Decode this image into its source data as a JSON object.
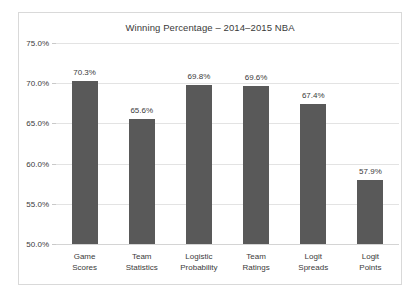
{
  "chart_data": {
    "type": "bar",
    "title": "Winning Percentage – 2014–2015 NBA",
    "xlabel": "",
    "ylabel": "",
    "ylim": [
      50.0,
      75.0
    ],
    "ytick_labels": [
      "75.0%",
      "70.0%",
      "65.0%",
      "60.0%",
      "55.0%",
      "50.0%"
    ],
    "ytick_values": [
      75.0,
      70.0,
      65.0,
      60.0,
      55.0,
      50.0
    ],
    "grid": true,
    "legend": "none",
    "bar_color": "#595959",
    "categories": [
      "Game Scores",
      "Team Statistics",
      "Logistic Probability",
      "Team Ratings",
      "Logit Spreads",
      "Logit Points"
    ],
    "category_lines": [
      [
        "Game",
        "Scores"
      ],
      [
        "Team",
        "Statistics"
      ],
      [
        "Logistic",
        "Probability"
      ],
      [
        "Team",
        "Ratings"
      ],
      [
        "Logit",
        "Spreads"
      ],
      [
        "Logit",
        "Points"
      ]
    ],
    "values": [
      70.3,
      65.6,
      69.8,
      69.6,
      67.4,
      57.9
    ],
    "value_labels": [
      "70.3%",
      "65.6%",
      "69.8%",
      "69.6%",
      "67.4%",
      "57.9%"
    ]
  }
}
